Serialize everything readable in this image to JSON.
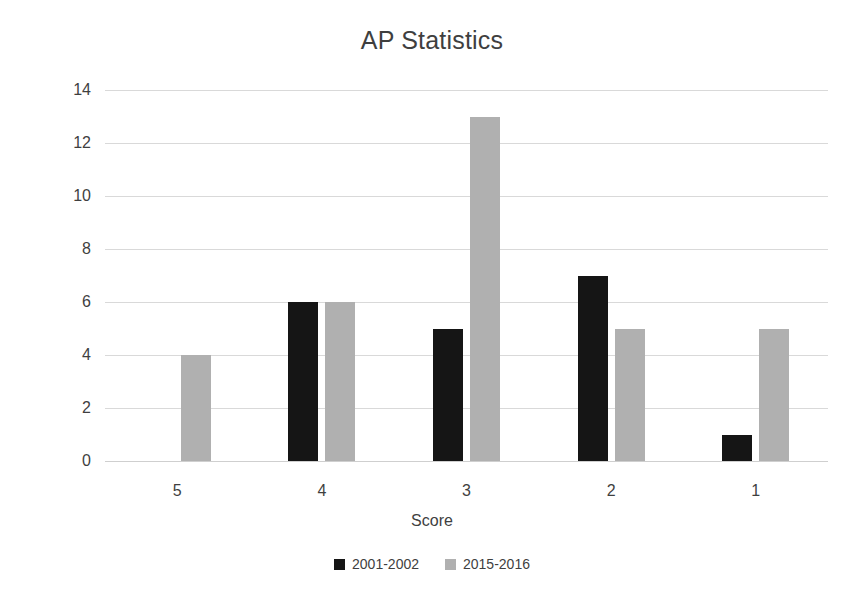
{
  "chart_data": {
    "type": "bar",
    "title": "AP Statistics",
    "xlabel": "Score",
    "ylabel": "Number of students",
    "categories": [
      "5",
      "4",
      "3",
      "2",
      "1"
    ],
    "series": [
      {
        "name": "2001-2002",
        "color": "#151515",
        "values": [
          0,
          6,
          5,
          7,
          1
        ]
      },
      {
        "name": "2015-2016",
        "color": "#b0b0b0",
        "values": [
          4,
          6,
          13,
          5,
          5
        ]
      }
    ],
    "ylim": [
      0,
      14
    ],
    "ytick_step": 2,
    "yticks": [
      "14",
      "12",
      "10",
      "8",
      "6",
      "4",
      "2",
      "0"
    ],
    "grid": "horizontal",
    "legend_position": "bottom"
  }
}
